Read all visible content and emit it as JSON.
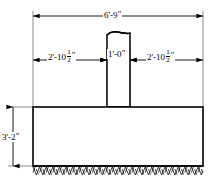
{
  "drawing": {
    "title": "Concrete footing and column elevation detail",
    "line_color": "#000000",
    "fill_color": "#ffffff",
    "hatch_color": "#1a1a1a"
  },
  "dimensions": {
    "total_width": {
      "label": "6'-9\"",
      "feet": "6'",
      "inches": "9\"",
      "whole": "6'-9",
      "mark": "\""
    },
    "left_offset": {
      "label": "2'-10 1/2\"",
      "whole": "2'-10",
      "frac_num": "1",
      "frac_den": "2",
      "mark": "\""
    },
    "column_width": {
      "label": "1'-0\"",
      "whole": "1'-0",
      "mark": "\""
    },
    "right_offset": {
      "label": "2'-10 1/2\"",
      "whole": "2'-10",
      "frac_num": "1",
      "frac_den": "2",
      "mark": "\""
    },
    "footing_height": {
      "label": "3'-2\"",
      "whole": "3'-2",
      "mark": "\""
    }
  },
  "parts": {
    "footing": "footing-block",
    "column": "column-pier",
    "ground": "ground-hatch",
    "break_line": "column-break-line"
  }
}
